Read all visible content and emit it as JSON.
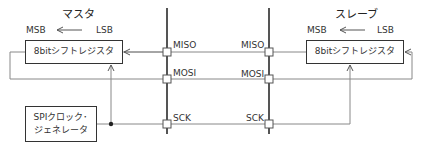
{
  "master": {
    "title": "マスタ",
    "msb": "MSB",
    "lsb": "LSB",
    "register": "8bitシフトレジスタ"
  },
  "slave": {
    "title": "スレーブ",
    "msb": "MSB",
    "lsb": "LSB",
    "register": "8bitシフトレジスタ"
  },
  "clock_generator": {
    "line1": "SPIクロック･",
    "line2": "ジェネレータ"
  },
  "signals": {
    "master_side": [
      "MISO",
      "MOSI",
      "SCK"
    ],
    "slave_side": [
      "MISO",
      "MOSI",
      "SCK"
    ]
  },
  "colors": {
    "bus": "#555555",
    "wire": "#888888",
    "box_border": "#333333",
    "text": "#333333"
  }
}
